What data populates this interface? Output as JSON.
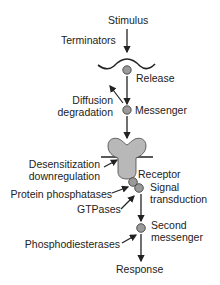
{
  "diagram": {
    "colors": {
      "line": "#222222",
      "node_fill": "#9a9a9a",
      "receptor_fill": "#b8b8b8"
    },
    "pathway": {
      "stimulus": "Stimulus",
      "release": "Release",
      "messenger": "Messenger",
      "receptor": "Receptor",
      "signal_transduction_line1": "Signal",
      "signal_transduction_line2": "transduction",
      "second_messenger_line1": "Second",
      "second_messenger_line2": "messenger",
      "response": "Response"
    },
    "terminators": {
      "terminators": "Terminators",
      "diffusion_line1": "Diffusion",
      "diffusion_line2": "degradation",
      "desensitization_line1": "Desensitization",
      "desensitization_line2": "downregulation",
      "protein_phosphatases": "Protein phosphatases",
      "gtpases": "GTPases",
      "phosphodiesterases": "Phosphodiesterases"
    }
  }
}
